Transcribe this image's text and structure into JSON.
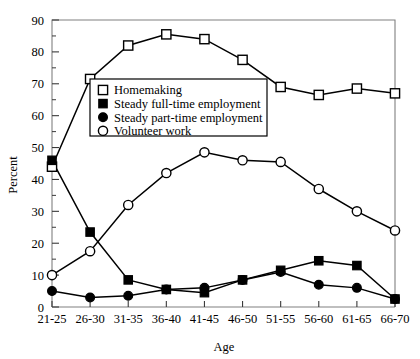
{
  "chart_data": {
    "type": "line",
    "title": "",
    "xlabel": "Age",
    "ylabel": "Percent",
    "categories": [
      "21-25",
      "26-30",
      "31-35",
      "36-40",
      "41-45",
      "46-50",
      "51-55",
      "56-60",
      "61-65",
      "66-70"
    ],
    "ylim": [
      0,
      90
    ],
    "ytick_labels": [
      "0",
      "10",
      "20",
      "30",
      "40",
      "50",
      "60",
      "70",
      "80",
      "90"
    ],
    "ytick_values": [
      0,
      10,
      20,
      30,
      40,
      50,
      60,
      70,
      80,
      90
    ],
    "minor_tick_step": 5,
    "grid": false,
    "legend_position": "upper-left-inside",
    "series": [
      {
        "name": "Homemaking",
        "marker": "open-square",
        "color": "#000000",
        "values": [
          44,
          71.5,
          82,
          85.5,
          84,
          77.5,
          69,
          66.5,
          68.5,
          67
        ]
      },
      {
        "name": "Steady full-time employment",
        "marker": "filled-square",
        "color": "#000000",
        "values": [
          46,
          23.5,
          8.5,
          5.5,
          4.5,
          8.5,
          11.5,
          14.5,
          13,
          2.5
        ]
      },
      {
        "name": "Steady part-time employment",
        "marker": "filled-circle",
        "color": "#000000",
        "values": [
          5,
          3,
          3.5,
          5.5,
          6,
          8.5,
          11,
          7,
          6,
          2.5
        ]
      },
      {
        "name": "Volunteer work",
        "marker": "open-circle",
        "color": "#000000",
        "values": [
          10,
          17.5,
          32,
          42,
          48.5,
          46,
          45.5,
          37,
          30,
          24
        ]
      }
    ]
  },
  "legend": {
    "entries": [
      {
        "label": "Homemaking",
        "marker": "open-square"
      },
      {
        "label": "Steady full-time employment",
        "marker": "filled-square"
      },
      {
        "label": "Steady part-time employment",
        "marker": "filled-circle"
      },
      {
        "label": "Volunteer work",
        "marker": "open-circle"
      }
    ]
  }
}
